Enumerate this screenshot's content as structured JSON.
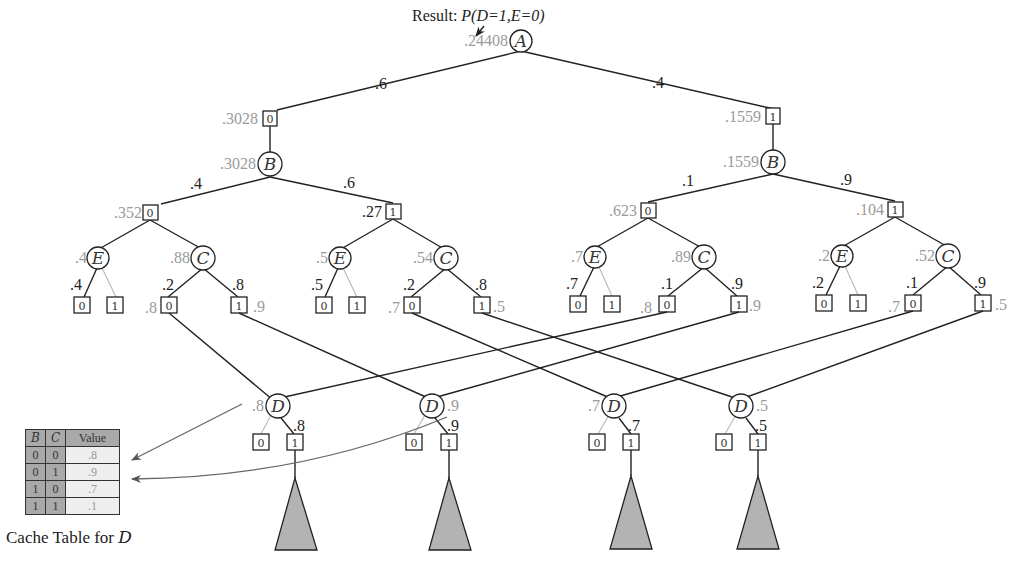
{
  "result_label": {
    "prefix": "Result: ",
    "expr": "P(D=1,E=0)"
  },
  "root": {
    "var": "A",
    "value": ".24408",
    "x": 521,
    "y": 40
  },
  "a_edges": [
    {
      "label": ".6",
      "value": ".3028",
      "branch": "0"
    },
    {
      "label": ".4",
      "value": ".1559",
      "branch": "1"
    }
  ],
  "b_nodes": [
    {
      "var": "B",
      "value": ".3028",
      "edges": [
        ".4",
        ".6"
      ]
    },
    {
      "var": "B",
      "value": ".1559",
      "edges": [
        ".1",
        ".9"
      ]
    }
  ],
  "c_boxes": [
    {
      "branch": "0",
      "value": ".352",
      "E": {
        "value": ".4",
        "edge0": ".4"
      },
      "C": {
        "value": ".88",
        "edge0": ".2",
        "edge1": ".8",
        "leaf0_value": ".8",
        "leaf1_value": ".9"
      }
    },
    {
      "branch": "1",
      "value": ".27",
      "E": {
        "value": ".5",
        "edge0": ".5"
      },
      "C": {
        "value": ".54",
        "edge0": ".2",
        "edge1": ".8",
        "leaf0_value": ".7",
        "leaf1_value": ".5"
      }
    },
    {
      "branch": "0",
      "value": ".623",
      "E": {
        "value": ".7",
        "edge0": ".7"
      },
      "C": {
        "value": ".89",
        "edge0": ".1",
        "edge1": ".9",
        "leaf0_value": ".8",
        "leaf1_value": ".9"
      }
    },
    {
      "branch": "1",
      "value": ".104",
      "E": {
        "value": ".2",
        "edge0": ".2"
      },
      "C": {
        "value": ".52",
        "edge0": ".1",
        "edge1": ".9",
        "leaf0_value": ".7",
        "leaf1_value": ".5"
      }
    }
  ],
  "d_nodes": [
    {
      "var": "D",
      "value": ".8",
      "edge1": ".8"
    },
    {
      "var": "D",
      "value": ".9",
      "edge1": ".9"
    },
    {
      "var": "D",
      "value": ".7",
      "edge1": ".7"
    },
    {
      "var": "D",
      "value": ".5",
      "edge1": ".5"
    }
  ],
  "cache_table": {
    "headers": [
      "B",
      "C",
      "Value"
    ],
    "rows": [
      {
        "B": "0",
        "C": "0",
        "value": ".8"
      },
      {
        "B": "0",
        "C": "1",
        "value": ".9"
      },
      {
        "B": "1",
        "C": "0",
        "value": ".7"
      },
      {
        "B": "1",
        "C": "1",
        "value": ".1"
      }
    ],
    "caption_prefix": "Cache Table for ",
    "caption_var": "D"
  },
  "colors": {
    "line": "#222222",
    "computed_value": "#9a9a9a",
    "subtree_fill": "#b3b3b3",
    "table_key": "#a9a9a9",
    "table_value": "#eeeeee"
  }
}
